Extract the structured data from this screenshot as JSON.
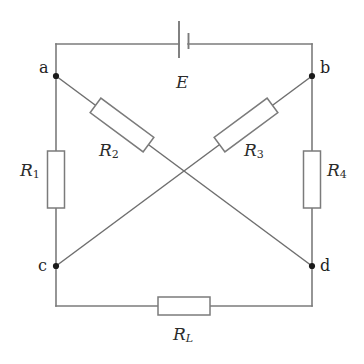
{
  "diagram": {
    "type": "circuit-schematic",
    "canvas": {
      "width": 364,
      "height": 364,
      "background": "#ffffff"
    },
    "style": {
      "wire_color": "#7b7b7b",
      "node_color": "#1a1a1a",
      "label_color": "#2b2b2b",
      "resistor_fill": "#ffffff"
    }
  },
  "nodes": [
    {
      "id": "a",
      "label": "a",
      "x": 56,
      "y": 76,
      "label_x": 39,
      "label_y": 60
    },
    {
      "id": "b",
      "label": "b",
      "x": 312,
      "y": 76,
      "label_x": 320,
      "label_y": 60
    },
    {
      "id": "c",
      "label": "c",
      "x": 56,
      "y": 266,
      "label_x": 38,
      "label_y": 260
    },
    {
      "id": "d",
      "label": "d",
      "x": 312,
      "y": 266,
      "label_x": 320,
      "label_y": 260
    }
  ],
  "components": {
    "source": {
      "id": "E",
      "label": "E",
      "symbol": "battery-cell",
      "label_x": 176,
      "label_y": 74
    },
    "resistors": [
      {
        "id": "R1",
        "label": "R",
        "subscript": "1",
        "subscript_italic": false,
        "orientation": "vertical",
        "between": [
          "a",
          "c"
        ],
        "label_x": 20,
        "label_y": 162
      },
      {
        "id": "R2",
        "label": "R",
        "subscript": "2",
        "subscript_italic": false,
        "orientation": "diagonal",
        "between": [
          "a",
          "d"
        ],
        "label_x": 99,
        "label_y": 142
      },
      {
        "id": "R3",
        "label": "R",
        "subscript": "3",
        "subscript_italic": false,
        "orientation": "diagonal",
        "between": [
          "b",
          "c"
        ],
        "label_x": 244,
        "label_y": 142
      },
      {
        "id": "R4",
        "label": "R",
        "subscript": "4",
        "subscript_italic": false,
        "orientation": "vertical",
        "between": [
          "b",
          "d"
        ],
        "label_x": 327,
        "label_y": 162
      },
      {
        "id": "RL",
        "label": "R",
        "subscript": "L",
        "subscript_italic": true,
        "orientation": "horizontal",
        "between": [
          "c",
          "d"
        ],
        "label_x": 173,
        "label_y": 326
      }
    ]
  }
}
